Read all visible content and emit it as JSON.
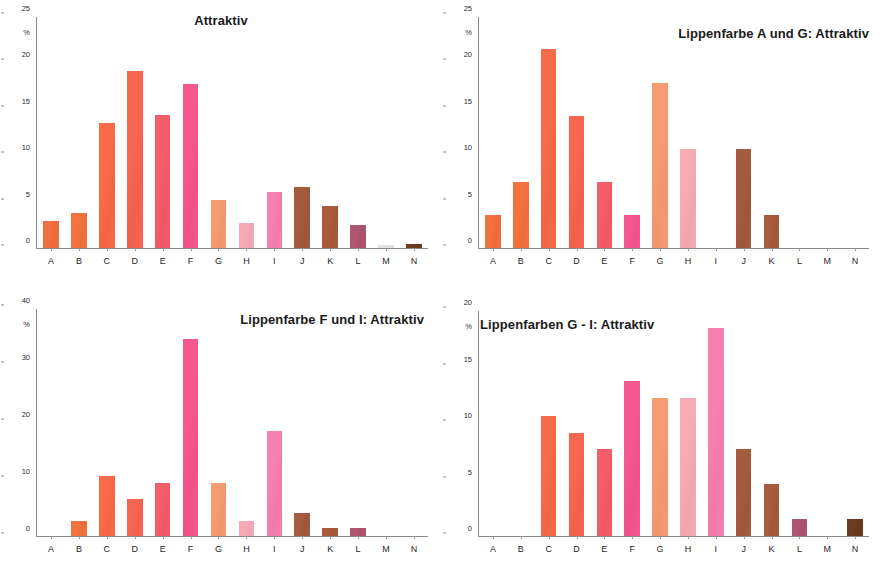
{
  "figure": {
    "categories": [
      "A",
      "B",
      "C",
      "D",
      "E",
      "F",
      "G",
      "H",
      "I",
      "J",
      "K",
      "L",
      "M",
      "N"
    ],
    "unit": "%",
    "bar_colors": {
      "A": "#F2703F",
      "B": "#F4723F",
      "C": "#F76B4A",
      "D": "#F66651",
      "E": "#F45E6B",
      "F": "#F4588E",
      "G": "#F79B70",
      "H": "#F7A9B6",
      "I": "#F681AE",
      "J": "#A55B3D",
      "K": "#A85B3F",
      "L": "#AE5773",
      "M": "#E3E3E3",
      "N": "#6B3B22"
    }
  },
  "chart_data": [
    {
      "type": "bar",
      "title": "Attraktiv",
      "title_position": "center",
      "xlabel": "",
      "ylabel": "%",
      "ylim": [
        0,
        25
      ],
      "yticks": [
        0,
        5,
        10,
        15,
        20,
        25
      ],
      "grid": false,
      "legend": "none",
      "categories": [
        "A",
        "B",
        "C",
        "D",
        "E",
        "F",
        "G",
        "H",
        "I",
        "J",
        "K",
        "L",
        "M",
        "N"
      ],
      "values": [
        2.9,
        3.8,
        13.5,
        19.2,
        14.4,
        17.8,
        5.2,
        2.7,
        6.1,
        6.6,
        4.6,
        2.5,
        0.3,
        0.4
      ]
    },
    {
      "type": "bar",
      "title": "Lippenfarbe A und G: Attraktiv",
      "title_position": "right",
      "xlabel": "",
      "ylabel": "%",
      "ylim": [
        0,
        25
      ],
      "yticks": [
        0,
        5,
        10,
        15,
        20,
        25
      ],
      "grid": false,
      "legend": "none",
      "categories": [
        "A",
        "B",
        "C",
        "D",
        "E",
        "F",
        "G",
        "H",
        "I",
        "J",
        "K",
        "L",
        "M",
        "N"
      ],
      "values": [
        3.6,
        7.1,
        21.5,
        14.3,
        7.1,
        3.6,
        17.9,
        10.7,
        0,
        10.7,
        3.6,
        0,
        0,
        0
      ]
    },
    {
      "type": "bar",
      "title": "Lippenfarbe F und I: Attraktiv",
      "title_position": "mid",
      "xlabel": "",
      "ylabel": "%",
      "ylim": [
        0,
        40
      ],
      "yticks": [
        0,
        10,
        20,
        30,
        40
      ],
      "grid": false,
      "legend": "none",
      "categories": [
        "A",
        "B",
        "C",
        "D",
        "E",
        "F",
        "G",
        "H",
        "I",
        "J",
        "K",
        "L",
        "M",
        "N"
      ],
      "values": [
        0,
        2.7,
        10.5,
        6.6,
        9.3,
        34.7,
        9.3,
        2.7,
        18.5,
        4.1,
        1.4,
        1.4,
        0,
        0
      ]
    },
    {
      "type": "bar",
      "title": "Lippenfarben G - I: Attraktiv",
      "title_position": "left",
      "xlabel": "",
      "ylabel": "%",
      "ylim": [
        0,
        20
      ],
      "yticks": [
        0,
        5,
        10,
        15,
        20
      ],
      "grid": false,
      "legend": "none",
      "categories": [
        "A",
        "B",
        "C",
        "D",
        "E",
        "F",
        "G",
        "H",
        "I",
        "J",
        "K",
        "L",
        "M",
        "N"
      ],
      "values": [
        0,
        0,
        10.7,
        9.2,
        7.7,
        13.8,
        12.3,
        12.3,
        18.5,
        7.7,
        4.6,
        1.5,
        0,
        1.5
      ]
    }
  ]
}
